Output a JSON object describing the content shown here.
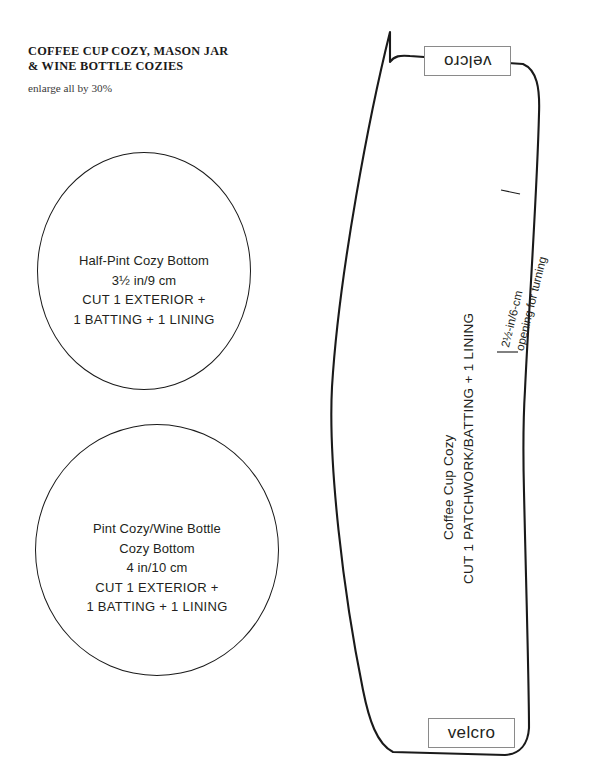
{
  "document": {
    "title_line_1": "COFFEE CUP COZY, MASON JAR",
    "title_line_2": "& WINE BOTTLE COZIES",
    "subtitle": "enlarge all by 30%"
  },
  "pieces": {
    "half_pint_bottom": {
      "name": "Half-Pint Cozy Bottom",
      "dimension": "3½ in/9 cm",
      "cut_line_1": "CUT 1 EXTERIOR +",
      "cut_line_2": "1 BATTING + 1 LINING"
    },
    "pint_bottom": {
      "name_line_1": "Pint Cozy/Wine Bottle",
      "name_line_2": "Cozy Bottom",
      "dimension": "4 in/10 cm",
      "cut_line_1": "CUT 1 EXTERIOR +",
      "cut_line_2": "1 BATTING + 1 LINING"
    },
    "coffee_cup_cozy": {
      "name": "Coffee Cup Cozy",
      "cut_line": "CUT 1 PATCHWORK/BATTING + 1 LINING",
      "velcro_top_label": "velcro",
      "velcro_bottom_label": "velcro",
      "opening_line_1": "2½-in/6-cm",
      "opening_line_2": "opening for turning"
    }
  },
  "colors": {
    "ink": "#231f20",
    "outline": "#1a1a1a",
    "box_border": "#8a8a8a",
    "paper": "#ffffff"
  }
}
